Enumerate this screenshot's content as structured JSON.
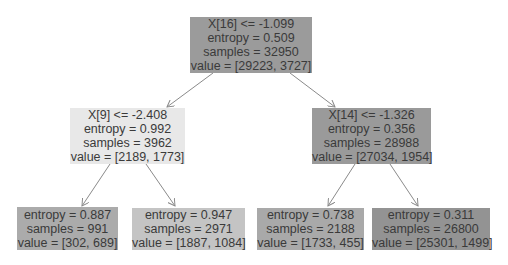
{
  "tree": {
    "nodes": [
      {
        "id": "root",
        "split": "X[16] <= -1.099",
        "entropy": "entropy = 0.509",
        "samples": "samples = 32950",
        "value": "value = [29223, 3727]",
        "color": "#9b9b9b",
        "box": [
          190,
          17,
          122,
          56
        ]
      },
      {
        "id": "left",
        "split": "X[9] <= -2.408",
        "entropy": "entropy = 0.992",
        "samples": "samples = 3962",
        "value": "value = [2189, 1773]",
        "color": "#e8e8e8",
        "box": [
          70,
          108,
          115,
          56
        ]
      },
      {
        "id": "right",
        "split": "X[14] <= -1.326",
        "entropy": "entropy = 0.356",
        "samples": "samples = 28988",
        "value": "value = [27034, 1954]",
        "color": "#9a9a9a",
        "box": [
          312,
          108,
          119,
          56
        ]
      },
      {
        "id": "leaf-ll",
        "entropy": "entropy = 0.887",
        "samples": "samples = 991",
        "value": "value = [302, 689]",
        "color": "#ababab",
        "box": [
          17,
          207,
          101,
          43
        ]
      },
      {
        "id": "leaf-lr",
        "entropy": "entropy = 0.947",
        "samples": "samples = 2971",
        "value": "value = [1887, 1084]",
        "color": "#c4c4c4",
        "box": [
          132,
          208,
          113,
          42
        ]
      },
      {
        "id": "leaf-rl",
        "entropy": "entropy = 0.738",
        "samples": "samples = 2188",
        "value": "value = [1733, 455]",
        "color": "#a9a9a9",
        "box": [
          257,
          208,
          107,
          42
        ]
      },
      {
        "id": "leaf-rr",
        "entropy": "entropy = 0.311",
        "samples": "samples = 26800",
        "value": "value = [25301, 1499]",
        "color": "#939393",
        "box": [
          372,
          208,
          118,
          42
        ]
      }
    ],
    "edges": [
      {
        "from": "root",
        "to": "left",
        "x1": 213,
        "y1": 73,
        "x2": 167,
        "y2": 107
      },
      {
        "from": "root",
        "to": "right",
        "x1": 290,
        "y1": 73,
        "x2": 335,
        "y2": 107
      },
      {
        "from": "left",
        "to": "leaf-ll",
        "x1": 110,
        "y1": 164,
        "x2": 82,
        "y2": 206
      },
      {
        "from": "left",
        "to": "leaf-lr",
        "x1": 146,
        "y1": 164,
        "x2": 175,
        "y2": 206
      },
      {
        "from": "right",
        "to": "leaf-rl",
        "x1": 355,
        "y1": 164,
        "x2": 328,
        "y2": 206
      },
      {
        "from": "right",
        "to": "leaf-rr",
        "x1": 390,
        "y1": 164,
        "x2": 418,
        "y2": 206
      }
    ]
  }
}
